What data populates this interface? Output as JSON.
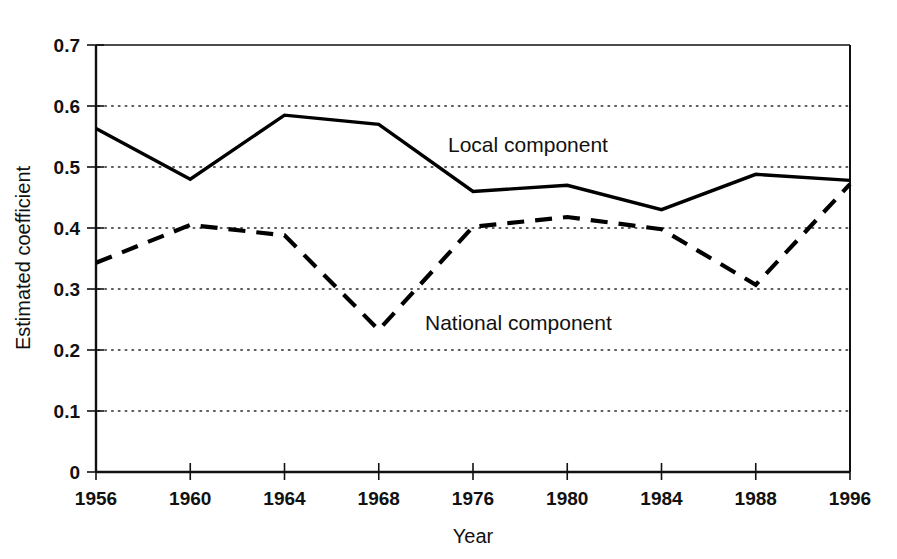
{
  "chart_data": {
    "type": "line",
    "title": "",
    "xlabel": "Year",
    "ylabel": "Estimated coefficient",
    "categories": [
      "1956",
      "1960",
      "1964",
      "1968",
      "1976",
      "1980",
      "1984",
      "1988",
      "1996"
    ],
    "x_tick_labels": [
      "1956",
      "1960",
      "1964",
      "1968",
      "1976",
      "1980",
      "1984",
      "1988",
      "1996"
    ],
    "y_tick_labels": [
      "0",
      "0.1",
      "0.2",
      "0.3",
      "0.4",
      "0.5",
      "0.6",
      "0.7"
    ],
    "y_tick_values": [
      0,
      0.1,
      0.2,
      0.3,
      0.4,
      0.5,
      0.6,
      0.7
    ],
    "ylim": [
      0,
      0.7
    ],
    "grid": "horizontal-dotted",
    "legend_position": "inline-annotation",
    "series": [
      {
        "name": "Local component",
        "style": "solid",
        "annotation": "Local component",
        "values": [
          0.563,
          0.48,
          0.585,
          0.57,
          0.46,
          0.47,
          0.43,
          0.488,
          0.478
        ]
      },
      {
        "name": "National component",
        "style": "dashed",
        "annotation": "National component",
        "values": [
          0.343,
          0.405,
          0.388,
          0.233,
          0.402,
          0.418,
          0.398,
          0.307,
          0.472
        ]
      }
    ]
  }
}
